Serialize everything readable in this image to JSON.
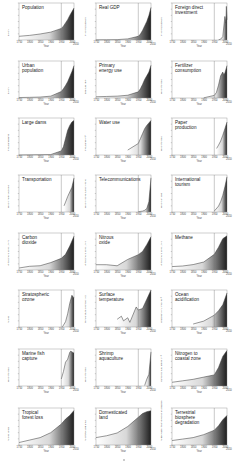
{
  "figure": {
    "x_axis_label": "Year",
    "x_ticks": [
      "1750",
      "1800",
      "1850",
      "1900",
      "1950",
      "2000",
      "2010"
    ],
    "reference_year": 1950,
    "fill_gradient": [
      "#ffffff",
      "#1e1e1e"
    ]
  },
  "chart_data": [
    {
      "type": "area",
      "title": "Population",
      "ylabel": "Billion",
      "x": [
        1750,
        1800,
        1850,
        1900,
        1950,
        1960,
        1970,
        1980,
        1990,
        2000,
        2010
      ],
      "values": [
        0.8,
        1.0,
        1.3,
        1.7,
        2.5,
        3.0,
        3.7,
        4.4,
        5.3,
        6.1,
        6.9
      ],
      "ylim": [
        0,
        8
      ]
    },
    {
      "type": "area",
      "title": "Real GDP",
      "ylabel": "Trillion US dollars",
      "x": [
        1750,
        1800,
        1850,
        1900,
        1950,
        1960,
        1970,
        1980,
        1990,
        2000,
        2010
      ],
      "values": [
        0.2,
        0.3,
        0.5,
        1.5,
        5,
        8,
        13,
        19,
        25,
        33,
        44
      ],
      "ylim": [
        0,
        50
      ]
    },
    {
      "type": "area",
      "title": "Foreign direct\ninvestment",
      "ylabel": "Trillion US dollars",
      "x": [
        1970,
        1980,
        1990,
        2000,
        2005,
        2007,
        2010
      ],
      "values": [
        0.01,
        0.05,
        0.2,
        1.4,
        1.0,
        2.0,
        1.2
      ],
      "ylim": [
        0,
        2.2
      ]
    },
    {
      "type": "area",
      "title": "Urban\npopulation",
      "ylabel": "Billion",
      "x": [
        1750,
        1800,
        1850,
        1900,
        1950,
        1960,
        1970,
        1980,
        1990,
        2000,
        2010
      ],
      "values": [
        0.05,
        0.07,
        0.1,
        0.2,
        0.7,
        1.0,
        1.35,
        1.75,
        2.3,
        2.85,
        3.5
      ],
      "ylim": [
        0,
        4
      ]
    },
    {
      "type": "area",
      "title": "Primary\nenergy use",
      "ylabel": "Exajoule (EJ)",
      "x": [
        1750,
        1800,
        1850,
        1900,
        1950,
        1960,
        1970,
        1980,
        1990,
        2000,
        2010
      ],
      "values": [
        20,
        25,
        30,
        45,
        100,
        150,
        220,
        300,
        360,
        420,
        530
      ],
      "ylim": [
        0,
        600
      ]
    },
    {
      "type": "area",
      "title": "Fertilizer\nconsumption",
      "ylabel": "Million tonnes",
      "x": [
        1900,
        1950,
        1960,
        1970,
        1980,
        1990,
        1995,
        2000,
        2010
      ],
      "values": [
        1,
        14,
        30,
        70,
        120,
        140,
        125,
        135,
        175
      ],
      "ylim": [
        0,
        200
      ]
    },
    {
      "type": "area",
      "title": "Large dams",
      "ylabel": "Thousand dams",
      "x": [
        1750,
        1900,
        1950,
        1960,
        1970,
        1980,
        1990,
        2000,
        2010
      ],
      "values": [
        0,
        0.5,
        5,
        10,
        20,
        30,
        36,
        40,
        42
      ],
      "ylim": [
        0,
        45
      ]
    },
    {
      "type": "area",
      "title": "Water use",
      "ylabel": "Thousand km³",
      "x": [
        1900,
        1950,
        1960,
        1970,
        1980,
        1990,
        2000,
        2010
      ],
      "values": [
        0.6,
        1.4,
        2.0,
        2.6,
        3.2,
        3.6,
        3.9,
        4.2
      ],
      "ylim": [
        0,
        4.5
      ]
    },
    {
      "type": "area",
      "title": "Paper\nproduction",
      "ylabel": "Million tonnes",
      "x": [
        1961,
        1970,
        1980,
        1990,
        2000,
        2010
      ],
      "values": [
        80,
        120,
        170,
        240,
        320,
        400
      ],
      "ylim": [
        0,
        450
      ]
    },
    {
      "type": "area",
      "title": "Transportation",
      "ylabel": "Million motor vehicles",
      "x": [
        1963,
        1970,
        1980,
        1990,
        2000,
        2010
      ],
      "values": [
        200,
        320,
        500,
        650,
        800,
        1100
      ],
      "ylim": [
        0,
        1200
      ]
    },
    {
      "type": "area",
      "title": "Telecommunications",
      "ylabel": "Million phone subscriptions",
      "x": [
        1950,
        1970,
        1980,
        1990,
        2000,
        2010
      ],
      "values": [
        50,
        150,
        300,
        600,
        1800,
        6000
      ],
      "ylim": [
        0,
        6500
      ]
    },
    {
      "type": "area",
      "title": "International\ntourism",
      "ylabel": "Million arrivals",
      "x": [
        1950,
        1970,
        1980,
        1990,
        2000,
        2010
      ],
      "values": [
        25,
        160,
        280,
        450,
        680,
        950
      ],
      "ylim": [
        0,
        1000
      ]
    },
    {
      "type": "area",
      "title": "Carbon\ndioxide",
      "ylabel": "Atmospheric conc., ppm",
      "x": [
        1750,
        1800,
        1850,
        1900,
        1950,
        1970,
        1990,
        2010
      ],
      "values": [
        277,
        283,
        285,
        296,
        311,
        325,
        354,
        389
      ],
      "ylim": [
        270,
        400
      ]
    },
    {
      "type": "area",
      "title": "Nitrous\noxide",
      "ylabel": "Atmospheric conc., ppb",
      "x": [
        1750,
        1800,
        1850,
        1900,
        1950,
        1970,
        1990,
        2010
      ],
      "values": [
        270,
        270,
        268,
        280,
        289,
        295,
        308,
        323
      ],
      "ylim": [
        260,
        330
      ]
    },
    {
      "type": "area",
      "title": "Methane",
      "ylabel": "Atmospheric conc., ppb",
      "x": [
        1750,
        1800,
        1850,
        1900,
        1950,
        1970,
        1990,
        2010
      ],
      "values": [
        720,
        740,
        790,
        880,
        1150,
        1400,
        1700,
        1800
      ],
      "ylim": [
        600,
        1900
      ]
    },
    {
      "type": "area",
      "title": "Stratospheric\nozone",
      "ylabel": "% loss",
      "x": [
        1955,
        1970,
        1980,
        1990,
        2000,
        2010
      ],
      "values": [
        0,
        2,
        5,
        9,
        12,
        11
      ],
      "ylim": [
        0,
        14
      ]
    },
    {
      "type": "area",
      "title": "Surface\ntemperature",
      "ylabel": "Temperature anomaly (°C)",
      "x": [
        1850,
        1870,
        1880,
        1900,
        1910,
        1940,
        1950,
        1970,
        1990,
        2010
      ],
      "values": [
        -0.35,
        -0.25,
        -0.4,
        -0.3,
        -0.45,
        0.05,
        -0.05,
        0.0,
        0.3,
        0.6
      ],
      "ylim": [
        -0.6,
        0.6
      ]
    },
    {
      "type": "area",
      "title": "Ocean\nacidification",
      "ylabel": "Hydrogen ion, nmol kg⁻¹",
      "x": [
        1850,
        1900,
        1950,
        1970,
        1990,
        2010
      ],
      "values": [
        6.5,
        6.7,
        7.1,
        7.4,
        7.8,
        8.6
      ],
      "ylim": [
        6.3,
        8.8
      ]
    },
    {
      "type": "area",
      "title": "Marine fish\ncapture",
      "ylabel": "Million tonnes",
      "x": [
        1950,
        1960,
        1970,
        1980,
        1990,
        1995,
        2000,
        2010
      ],
      "values": [
        17,
        35,
        58,
        65,
        82,
        85,
        83,
        80
      ],
      "ylim": [
        0,
        90
      ]
    },
    {
      "type": "area",
      "title": "Shrimp\naquaculture",
      "ylabel": "Million tonnes",
      "x": [
        1980,
        1990,
        2000,
        2010
      ],
      "values": [
        0.05,
        0.7,
        1.2,
        3.5
      ],
      "ylim": [
        0,
        3.8
      ]
    },
    {
      "type": "area",
      "title": "Nitrogen to\ncoastal zone",
      "ylabel": "Human N flux, Mtons yr⁻¹",
      "x": [
        1750,
        1800,
        1850,
        1900,
        1950,
        1970,
        1990,
        2010
      ],
      "values": [
        5,
        7,
        9,
        12,
        15,
        25,
        40,
        48
      ],
      "ylim": [
        0,
        50
      ]
    },
    {
      "type": "area",
      "title": "Tropical\nforest loss",
      "ylabel": "% loss (area)",
      "x": [
        1750,
        1800,
        1850,
        1900,
        1950,
        1970,
        1990,
        2010
      ],
      "values": [
        2,
        4,
        6,
        10,
        17,
        21,
        24,
        28
      ],
      "ylim": [
        0,
        30
      ]
    },
    {
      "type": "area",
      "title": "Domesticated\nland",
      "ylabel": "% of total land area",
      "x": [
        1750,
        1800,
        1850,
        1900,
        1950,
        1970,
        1990,
        2010
      ],
      "values": [
        8,
        10,
        13,
        20,
        30,
        34,
        36,
        37
      ],
      "ylim": [
        0,
        40
      ]
    },
    {
      "type": "area",
      "title": "Terrestrial\nbiosphere\ndegradation",
      "ylabel": "% decrease mean species abundance",
      "x": [
        1750,
        1800,
        1850,
        1900,
        1950,
        1970,
        1990,
        2010
      ],
      "values": [
        3,
        4,
        5,
        7,
        10,
        13,
        17,
        20
      ],
      "ylim": [
        0,
        25
      ]
    }
  ]
}
